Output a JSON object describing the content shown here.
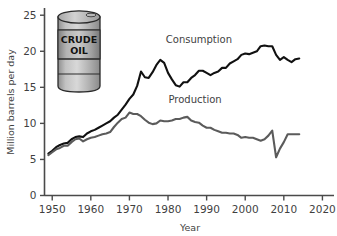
{
  "chart_data": {
    "type": "line",
    "title": "",
    "xlabel": "Year",
    "ylabel": "Million barrels per day",
    "xlim": [
      1948,
      2023
    ],
    "ylim": [
      0,
      26
    ],
    "xticks": [
      1950,
      1960,
      1970,
      1980,
      1990,
      2000,
      2010,
      2020
    ],
    "xticklabels": [
      "1950",
      "1960",
      "1970",
      "1980",
      "1990",
      "2000",
      "2010",
      "2020"
    ],
    "yticks": [
      0,
      5,
      10,
      15,
      20,
      25
    ],
    "yticklabels": [
      "0",
      "5",
      "10",
      "15",
      "20",
      "25"
    ],
    "grid": false,
    "legend_position": "inline-annotations",
    "series": [
      {
        "name": "Consumption",
        "color": "#111111",
        "linewidth": 2.1,
        "label_x": 1988,
        "label_y": 21.2,
        "x": [
          1949,
          1950,
          1951,
          1952,
          1953,
          1954,
          1955,
          1956,
          1957,
          1958,
          1959,
          1960,
          1961,
          1962,
          1963,
          1964,
          1965,
          1966,
          1967,
          1968,
          1969,
          1970,
          1971,
          1972,
          1973,
          1974,
          1975,
          1976,
          1977,
          1978,
          1979,
          1980,
          1981,
          1982,
          1983,
          1984,
          1985,
          1986,
          1987,
          1988,
          1989,
          1990,
          1991,
          1992,
          1993,
          1994,
          1995,
          1996,
          1997,
          1998,
          1999,
          2000,
          2001,
          2002,
          2003,
          2004,
          2005,
          2006,
          2007,
          2008,
          2009,
          2010,
          2011,
          2012,
          2013,
          2014
        ],
        "y": [
          5.8,
          6.2,
          6.7,
          7.0,
          7.2,
          7.3,
          7.8,
          8.1,
          8.2,
          8.1,
          8.6,
          8.9,
          9.1,
          9.4,
          9.7,
          10.0,
          10.3,
          10.8,
          11.2,
          11.9,
          12.6,
          13.4,
          14.0,
          15.2,
          17.2,
          16.4,
          16.3,
          17.1,
          18.1,
          18.8,
          18.4,
          17.0,
          16.1,
          15.3,
          15.1,
          15.7,
          15.7,
          16.3,
          16.7,
          17.3,
          17.3,
          17.0,
          16.7,
          17.0,
          17.2,
          17.7,
          17.7,
          18.3,
          18.6,
          18.9,
          19.5,
          19.7,
          19.6,
          19.8,
          20.0,
          20.7,
          20.8,
          20.7,
          20.7,
          19.5,
          18.8,
          19.2,
          18.8,
          18.5,
          18.9,
          19.0
        ]
      },
      {
        "name": "Production",
        "color": "#5b5b5b",
        "linewidth": 2.1,
        "label_x": 1987,
        "label_y": 12.8,
        "x": [
          1949,
          1950,
          1951,
          1952,
          1953,
          1954,
          1955,
          1956,
          1957,
          1958,
          1959,
          1960,
          1961,
          1962,
          1963,
          1964,
          1965,
          1966,
          1967,
          1968,
          1969,
          1970,
          1971,
          1972,
          1973,
          1974,
          1975,
          1976,
          1977,
          1978,
          1979,
          1980,
          1981,
          1982,
          1983,
          1984,
          1985,
          1986,
          1987,
          1988,
          1989,
          1990,
          1991,
          1992,
          1993,
          1994,
          1995,
          1996,
          1997,
          1998,
          1999,
          2000,
          2001,
          2002,
          2003,
          2004,
          2005,
          2006,
          2007,
          2008,
          2009,
          2010,
          2011,
          2012,
          2013,
          2014
        ],
        "y": [
          5.6,
          6.0,
          6.4,
          6.6,
          6.9,
          6.9,
          7.4,
          7.8,
          7.9,
          7.5,
          7.8,
          8.0,
          8.1,
          8.3,
          8.5,
          8.6,
          8.8,
          9.5,
          10.1,
          10.6,
          10.8,
          11.5,
          11.3,
          11.3,
          11.0,
          10.5,
          10.1,
          9.9,
          10.0,
          10.4,
          10.3,
          10.3,
          10.4,
          10.6,
          10.6,
          10.8,
          10.9,
          10.4,
          10.2,
          10.1,
          9.7,
          9.4,
          9.4,
          9.1,
          8.9,
          8.7,
          8.7,
          8.6,
          8.6,
          8.4,
          8.0,
          8.1,
          8.0,
          8.0,
          7.8,
          7.6,
          7.8,
          8.3,
          9.0,
          5.3,
          6.5,
          7.4,
          8.5,
          8.5,
          8.5,
          8.5
        ]
      }
    ],
    "annotations": [
      {
        "name": "crude-oil-barrel",
        "line1": "CRUDE",
        "line2": "OIL"
      }
    ]
  },
  "axis": {
    "y_title": "Million barrels per day",
    "x_title": "Year"
  },
  "colors": {
    "consumption": "#111111",
    "production": "#5b5b5b",
    "axis": "#4a4a4a",
    "background": "#ffffff",
    "barrel_body": "#b5b5b5",
    "barrel_band": "#9d9d9d",
    "barrel_outline": "#2a2a2a"
  }
}
